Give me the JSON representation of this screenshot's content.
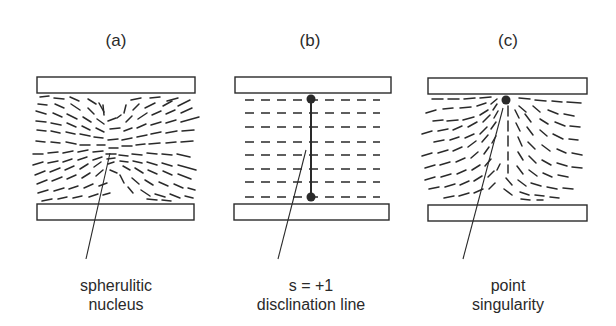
{
  "figure": {
    "panels": [
      {
        "id": "a",
        "label": "(a)",
        "caption_line1": "spherulitic",
        "caption_line2": "nucleus",
        "texture": "radial-spherulitic"
      },
      {
        "id": "b",
        "label": "(b)",
        "caption_line1": "s = +1",
        "caption_line2": "disclination line",
        "texture": "uniform-horizontal"
      },
      {
        "id": "c",
        "label": "(c)",
        "caption_line1": "point",
        "caption_line2": "singularity",
        "texture": "hedgehog-at-top-plate"
      }
    ],
    "colors": {
      "ink": "#2a2a2a",
      "background": "#ffffff"
    }
  }
}
